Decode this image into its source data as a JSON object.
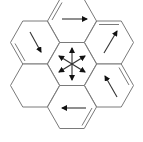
{
  "diagram": {
    "type": "hexagonal-grid",
    "colors": {
      "edge": "#7a7a7a",
      "arrow": "#333333",
      "arrowhead": "#111111",
      "background": "#ffffff"
    },
    "cells": [
      {
        "id": "center",
        "cx": 72,
        "cy": 64,
        "arrow": "six-way-star",
        "double_edge": null
      },
      {
        "id": "top",
        "cx": 72,
        "cy": 21,
        "arrow": "right",
        "double_edge": "upper-left"
      },
      {
        "id": "upper-right",
        "cx": 109,
        "cy": 42.5,
        "arrow": "up-right",
        "double_edge": "top"
      },
      {
        "id": "lower-right",
        "cx": 109,
        "cy": 85.5,
        "arrow": "up-left",
        "double_edge": "upper-right"
      },
      {
        "id": "bottom",
        "cx": 72,
        "cy": 107,
        "arrow": "left",
        "double_edge": "lower-right"
      },
      {
        "id": "lower-left",
        "cx": 35,
        "cy": 85.5,
        "arrow": null,
        "double_edge": null
      },
      {
        "id": "upper-left",
        "cx": 35,
        "cy": 42.5,
        "arrow": "down-right",
        "double_edge": "lower-left"
      }
    ]
  }
}
